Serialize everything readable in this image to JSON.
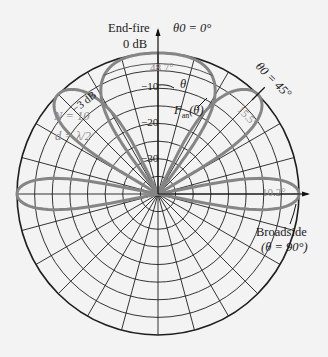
{
  "chart_data": {
    "type": "polar",
    "title": "",
    "scale": {
      "unit": "dB",
      "max": 0,
      "min": -40,
      "ring_step_db": 5,
      "spoke_step_deg": 15,
      "angle_reference": "theta measured from array axis (end-fire, up), clockwise"
    },
    "tick_labels": [
      "0 dB",
      "-10",
      "-20",
      "-30"
    ],
    "array": {
      "N": 10,
      "d": "λ/2"
    },
    "series": [
      {
        "name": "θ0 = 0°",
        "scan_angle_deg": 0,
        "beamwidth_deg": 48.7,
        "beamwidth_label": "48.7°"
      },
      {
        "name": "θ0 = 45°",
        "scan_angle_deg": 45,
        "beamwidth_deg": 15.5,
        "beamwidth_label": "15.5°"
      },
      {
        "name": "θ0 = 90°",
        "scan_angle_deg": 90,
        "beamwidth_deg": 10.2,
        "beamwidth_label": "10.2°"
      }
    ],
    "annotations": [
      "End-fire",
      "θ0 = 0°",
      "θ0 = 45°",
      "Broadside (θ = 90°)",
      "-3 dB",
      "N = 10",
      "d = λ/2",
      "θ",
      "Fan(θ)"
    ]
  },
  "labels": {
    "endfire": "End-fire",
    "theta0_0": "θ0 = 0°",
    "theta0_45": "θ0 = 45°",
    "zero_db": "0 dB",
    "minus10": "−10",
    "minus20": "−20",
    "minus30": "−30",
    "minus3db": "−3 dB",
    "n_value": "N = 10",
    "d_value": "d = λ/2",
    "bw_endfire": "48.7°",
    "bw_45": "15.5°",
    "bw_broadside": "10.2°",
    "theta": "θ",
    "fan": "F",
    "fan_sub": "an",
    "fan_arg": "(θ)",
    "broadside": "Broadside",
    "broadside_theta": "(θ = 90°)"
  },
  "style": {
    "grid_color": "#1e1e1e",
    "lobe_color": "#858585",
    "background": "#f3f3f3"
  }
}
